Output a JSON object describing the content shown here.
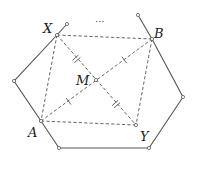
{
  "diagram": {
    "labels": {
      "X": "X",
      "B": "B",
      "M": "M",
      "A": "A",
      "Y": "Y",
      "ellipsis": "..."
    },
    "points": {
      "top_left_end": [
        67,
        24
      ],
      "X": [
        57,
        35
      ],
      "left": [
        14,
        81
      ],
      "A": [
        41,
        121
      ],
      "bottom_left": [
        59,
        148
      ],
      "bottom_right": [
        149,
        148
      ],
      "right": [
        183,
        97
      ],
      "B": [
        152,
        39
      ],
      "top_right_end": [
        138,
        15
      ],
      "M": [
        96,
        80
      ],
      "Y": [
        136,
        125
      ]
    },
    "solid_polyline": [
      "top_left_end",
      "X",
      "left",
      "A",
      "bottom_left",
      "bottom_right",
      "right",
      "B",
      "top_right_end"
    ],
    "dashed_segments": [
      [
        "X",
        "B"
      ],
      [
        "X",
        "A"
      ],
      [
        "B",
        "Y"
      ],
      [
        "A",
        "Y"
      ],
      [
        "X",
        "Y"
      ],
      [
        "A",
        "B"
      ]
    ],
    "tick_marks": {
      "single": [
        "A-M",
        "M-B"
      ],
      "double": [
        "X-M",
        "M-Y"
      ]
    },
    "colors": {
      "stroke": "#555555",
      "label": "#222222",
      "background": "#ffffff"
    }
  }
}
